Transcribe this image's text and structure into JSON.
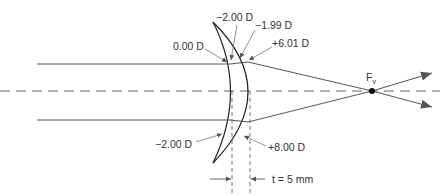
{
  "diagram": {
    "type": "thick meniscus lens ray diagram",
    "colors": {
      "line": "#444444",
      "axis_dash": "#666666",
      "text": "#333333"
    },
    "labels": {
      "front_surface_top": "−2.00 D",
      "back_surface_top": "−1.99 D",
      "front_ray_power": "0.00 D",
      "back_ray_power": "+6.01 D",
      "front_surface_bottom": "−2.00 D",
      "back_surface_bottom": "+8.00 D",
      "focal_point": "F",
      "focal_point_sub": "v",
      "thickness": "t = 5 mm"
    }
  }
}
